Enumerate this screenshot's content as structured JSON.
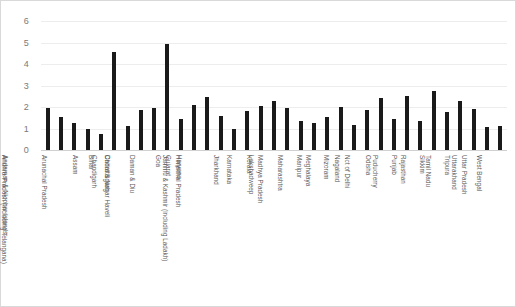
{
  "chart_data": {
    "type": "bar",
    "title": "",
    "subtitle": "",
    "xlabel": "",
    "ylabel": "",
    "ylim": [
      0,
      6
    ],
    "y_ticks": [
      0,
      1,
      2,
      3,
      4,
      5,
      6
    ],
    "grid": true,
    "legend": "none",
    "bar_color": "#1a1a1a",
    "gridline_color": "#ededed",
    "axis_text_color": "#7a7a7a",
    "label_text_color": "#595959",
    "categories": [
      "Andaman & Nicobar Islands",
      "Andhra Pradesh (including Telangana)",
      "Arunachal Pradesh",
      "Assam",
      "Bihar",
      "Chandigarh",
      "Chhattisgarh",
      "Dadra & Nagar Haveli",
      "Daman & Diu",
      "Goa",
      "Gujarat",
      "Haryana",
      "Himachal Pradesh",
      "Jammu & Kashmir (including Ladakh)",
      "Jharkhand",
      "Karnataka",
      "Kerala",
      "Lakshadweep",
      "Madhya Pradesh",
      "Maharashtra",
      "Manipur",
      "Meghalaya",
      "Mizoram",
      "Nagaland",
      "Nct of Delhi",
      "Odisha",
      "Puducherry",
      "Punjab",
      "Rajasthan",
      "Sikkim",
      "Tamil Nadu",
      "Tripura",
      "Uttarakhand",
      "Uttar Pradesh",
      "West Bengal"
    ],
    "values": [
      1.95,
      1.53,
      1.27,
      0.96,
      0.75,
      4.55,
      1.12,
      1.85,
      1.97,
      4.95,
      1.45,
      2.08,
      2.45,
      1.56,
      1.0,
      1.82,
      2.07,
      2.28,
      1.95,
      1.34,
      1.27,
      1.52,
      2.0,
      1.18,
      1.85,
      2.42,
      1.46,
      2.5,
      1.33,
      2.73,
      1.77,
      2.3,
      1.92,
      1.08,
      1.13
    ]
  }
}
